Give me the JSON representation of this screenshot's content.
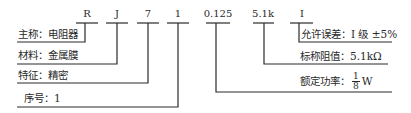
{
  "model_code": {
    "segments": [
      {
        "id": "main_name",
        "code": "R"
      },
      {
        "id": "material",
        "code": "J"
      },
      {
        "id": "feature",
        "code": "7"
      },
      {
        "id": "serial",
        "code": "1"
      },
      {
        "id": "power",
        "code": "0.125"
      },
      {
        "id": "resistance",
        "code": "5.1k"
      },
      {
        "id": "tolerance",
        "code": "I"
      }
    ]
  },
  "labels": {
    "main_name": "主称：电阻器",
    "material": "材料：金属膜",
    "feature": "特征：精密",
    "serial": "序号：1",
    "tolerance": "允许误差：I 级 ±5%",
    "resistance": "标称阻值：5.1kΩ",
    "power_prefix": "额定功率：",
    "power_numerator": "1",
    "power_denominator": "8",
    "power_unit": "W"
  },
  "colors": {
    "line": "#2a2a2a",
    "text": "#2a2a2a",
    "background": "#ffffff"
  }
}
